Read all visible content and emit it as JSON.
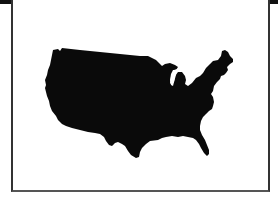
{
  "figure": {
    "fill_color": "#0a0a0a",
    "background_color": "#ffffff",
    "frame_color": "#333333"
  }
}
